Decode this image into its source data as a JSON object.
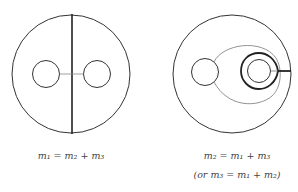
{
  "figure": {
    "left_panel": {
      "caption": "m₁ = m₂ + m₃"
    },
    "right_panel": {
      "caption": "m₂ = m₁ + m₃",
      "caption_alt": "(or m₃ = m₁ + m₂)"
    }
  },
  "colors": {
    "stroke": "#333333",
    "thin_stroke": "#777777",
    "background": "#ffffff"
  }
}
